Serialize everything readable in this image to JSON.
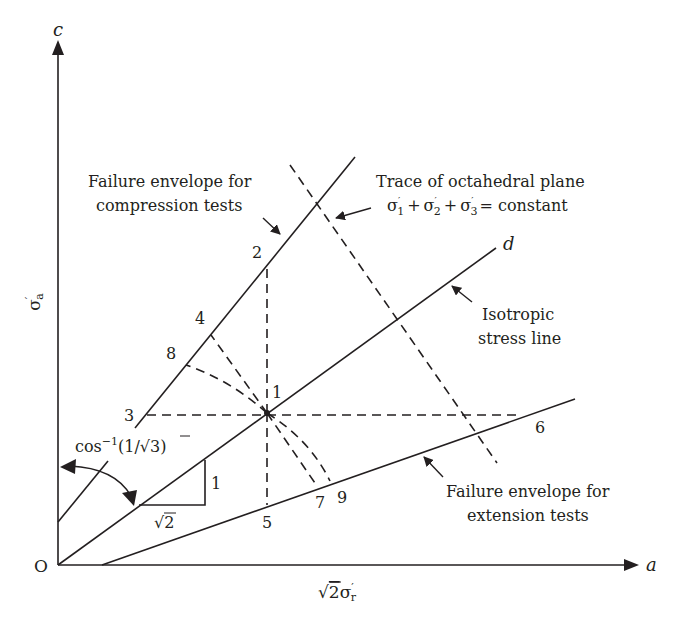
{
  "figure": {
    "axes": {
      "vertical_axis_end_label": "c",
      "horizontal_axis_end_label": "a",
      "origin_label": "O",
      "vertical_axis_title": "σ′a",
      "vertical_axis_title_main": "σ",
      "vertical_axis_title_prime": "′",
      "vertical_axis_title_sub": "a",
      "horizontal_axis_title_sqrt": "√",
      "horizontal_axis_title_two": "2",
      "horizontal_axis_title_sigma": "σ",
      "horizontal_axis_title_prime": "′",
      "horizontal_axis_title_sub": "r",
      "horizontal_axis_title": "√2σ′r"
    },
    "lines": {
      "isotropic_end_label": "d"
    },
    "annotations": {
      "compression_envelope": [
        "Failure envelope for",
        "compression tests"
      ],
      "extension_envelope": [
        "Failure envelope for",
        "extension tests"
      ],
      "isotropic_line": [
        "Isotropic",
        "stress line"
      ],
      "octahedral_trace_title": "Trace of octahedral plane",
      "octahedral_trace_equation": "σ′1 + σ′2 + σ′3 = constant",
      "eq_parts": {
        "s": "σ",
        "p": "′",
        "i1": "1",
        "i2": "2",
        "i3": "3",
        "plus": "+",
        "eq": "= constant"
      },
      "angle_label": "cos⁻¹(1/√3)",
      "angle_parts": {
        "cos": "cos",
        "sup": "−1",
        "open": "(1/",
        "root": "√",
        "three": "3",
        "close": ")"
      },
      "slope_rise": "1",
      "slope_run": "√2"
    },
    "points": [
      {
        "id": "1",
        "label": "1"
      },
      {
        "id": "2",
        "label": "2"
      },
      {
        "id": "3",
        "label": "3"
      },
      {
        "id": "4",
        "label": "4"
      },
      {
        "id": "5",
        "label": "5"
      },
      {
        "id": "6",
        "label": "6"
      },
      {
        "id": "7",
        "label": "7"
      },
      {
        "id": "8",
        "label": "8"
      },
      {
        "id": "9",
        "label": "9"
      }
    ]
  }
}
